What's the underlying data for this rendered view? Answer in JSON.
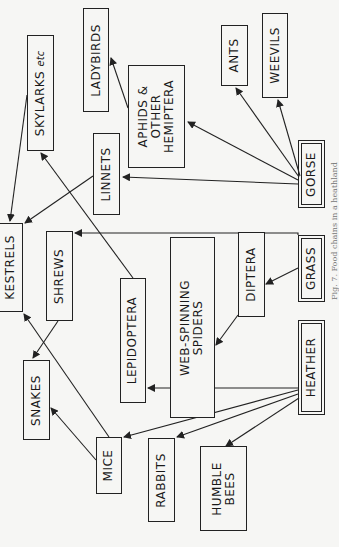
{
  "diagram": {
    "type": "food-web",
    "orientation": "rotated-90-ccw",
    "nodes": {
      "skylarks": {
        "label": "SKYLARKS",
        "suffix": "etc"
      },
      "ladybirds": {
        "label": "LADYBIRDS"
      },
      "aphids": {
        "line1": "APHIDS &",
        "line2": "OTHER",
        "line3": "HEMIPTERA"
      },
      "ants": {
        "label": "ANTS"
      },
      "weevils": {
        "label": "WEEVILS"
      },
      "linnets": {
        "label": "LINNETS"
      },
      "kestrels": {
        "label": "KESTRELS"
      },
      "shrews": {
        "label": "SHREWS"
      },
      "lepidoptera": {
        "label": "LEPIDOPTERA"
      },
      "spiders": {
        "line1": "WEB-SPINNING",
        "line2": "SPIDERS"
      },
      "diptera": {
        "label": "DIPTERA"
      },
      "gorse": {
        "label": "GORSE"
      },
      "grass": {
        "label": "GRASS"
      },
      "heather": {
        "label": "HEATHER"
      },
      "snakes": {
        "label": "SNAKES"
      },
      "mice": {
        "label": "MICE"
      },
      "rabbits": {
        "label": "RABBITS"
      },
      "bees": {
        "line1": "HUMBLE",
        "line2": "BEES"
      }
    },
    "edges": [
      {
        "from": "gorse",
        "to": "aphids"
      },
      {
        "from": "gorse",
        "to": "ants"
      },
      {
        "from": "gorse",
        "to": "weevils"
      },
      {
        "from": "gorse",
        "to": "linnets"
      },
      {
        "from": "aphids",
        "to": "ladybirds"
      },
      {
        "from": "grass",
        "to": "shrews"
      },
      {
        "from": "grass",
        "to": "diptera"
      },
      {
        "from": "diptera",
        "to": "spiders"
      },
      {
        "from": "heather",
        "to": "lepidoptera"
      },
      {
        "from": "heather",
        "to": "mice"
      },
      {
        "from": "heather",
        "to": "rabbits"
      },
      {
        "from": "heather",
        "to": "bees"
      },
      {
        "from": "lepidoptera",
        "to": "skylarks"
      },
      {
        "from": "skylarks",
        "to": "kestrels"
      },
      {
        "from": "linnets",
        "to": "kestrels"
      },
      {
        "from": "mice",
        "to": "kestrels"
      },
      {
        "from": "mice",
        "to": "snakes"
      },
      {
        "from": "shrews",
        "to": "snakes"
      }
    ],
    "double_bordered_nodes": [
      "gorse",
      "grass",
      "heather"
    ],
    "caption": "Fig. 7. Food chains in a heathland"
  },
  "colors": {
    "ink": "#222222",
    "paper": "#f6f6f4"
  }
}
